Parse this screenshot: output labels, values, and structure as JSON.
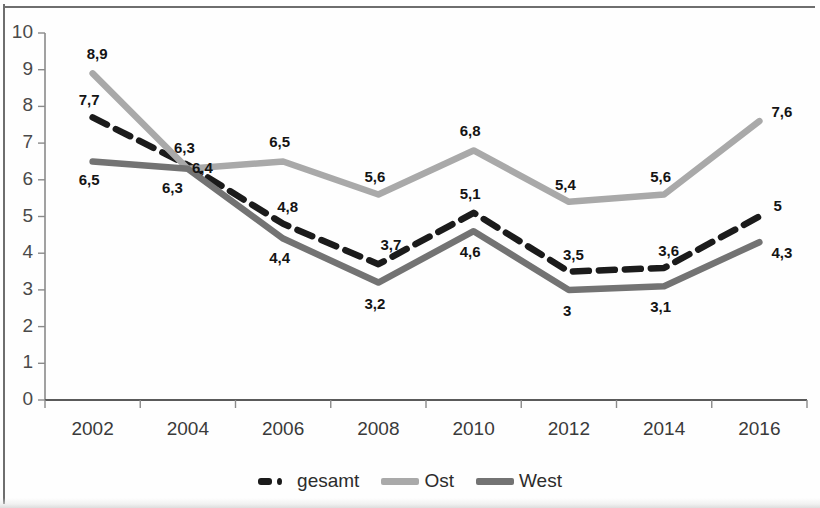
{
  "chart_data": {
    "type": "line",
    "title": "",
    "subtitle": "",
    "xlabel": "",
    "ylabel": "",
    "ylim": [
      0,
      10
    ],
    "ytick_labels": [
      "0",
      "1",
      "2",
      "3",
      "4",
      "5",
      "6",
      "7",
      "8",
      "9",
      "10"
    ],
    "categories": [
      "2002",
      "2004",
      "2006",
      "2008",
      "2010",
      "2012",
      "2014",
      "2016"
    ],
    "grid": false,
    "legend_position": "bottom",
    "series": [
      {
        "name": "gesamt",
        "style": "dashed",
        "color": "#1b1b1b",
        "values": [
          7.7,
          6.4,
          4.8,
          3.7,
          5.1,
          3.5,
          3.6,
          5.0
        ],
        "labels": [
          "7,7",
          "6,4",
          "4,8",
          "3,7",
          "5,1",
          "3,5",
          "3,6",
          "5"
        ]
      },
      {
        "name": "Ost",
        "style": "solid",
        "color": "#a9a9a9",
        "values": [
          8.9,
          6.3,
          6.5,
          5.6,
          6.8,
          5.4,
          5.6,
          7.6
        ],
        "labels": [
          "8,9",
          "6,3",
          "6,5",
          "5,6",
          "6,8",
          "5,4",
          "5,6",
          "7,6"
        ]
      },
      {
        "name": "West",
        "style": "solid",
        "color": "#737373",
        "values": [
          6.5,
          6.3,
          4.4,
          3.2,
          4.6,
          3.0,
          3.1,
          4.3
        ],
        "labels": [
          "6,5",
          "6,3",
          "4,4",
          "3,2",
          "4,6",
          "3",
          "3,1",
          "4,3"
        ]
      }
    ]
  },
  "legend": {
    "items": [
      {
        "label": "gesamt",
        "color": "#1b1b1b",
        "style": "dashed"
      },
      {
        "label": "Ost",
        "color": "#a9a9a9",
        "style": "solid"
      },
      {
        "label": "West",
        "color": "#737373",
        "style": "solid"
      }
    ]
  },
  "axes": {
    "y_min": 0,
    "y_max": 10,
    "y_step": 1,
    "x_categories": [
      "2002",
      "2004",
      "2006",
      "2008",
      "2010",
      "2012",
      "2014",
      "2016"
    ]
  },
  "label_offsets": {
    "gesamt": [
      {
        "dx": -14,
        "dy": -26
      },
      {
        "dx": 4,
        "dy": -6
      },
      {
        "dx": -6,
        "dy": -26
      },
      {
        "dx": 2,
        "dy": -28
      },
      {
        "dx": -14,
        "dy": -28
      },
      {
        "dx": -6,
        "dy": -26
      },
      {
        "dx": -6,
        "dy": -26
      },
      {
        "dx": 14,
        "dy": -20
      }
    ],
    "Ost": [
      {
        "dx": -6,
        "dy": -28
      },
      {
        "dx": -14,
        "dy": -30
      },
      {
        "dx": -14,
        "dy": -28
      },
      {
        "dx": -14,
        "dy": -26
      },
      {
        "dx": -14,
        "dy": -28
      },
      {
        "dx": -14,
        "dy": -26
      },
      {
        "dx": -14,
        "dy": -26
      },
      {
        "dx": 12,
        "dy": -18
      }
    ],
    "West": [
      {
        "dx": -14,
        "dy": 10
      },
      {
        "dx": -26,
        "dy": 10
      },
      {
        "dx": -14,
        "dy": 10
      },
      {
        "dx": -14,
        "dy": 12
      },
      {
        "dx": -14,
        "dy": 12
      },
      {
        "dx": -6,
        "dy": 12
      },
      {
        "dx": -14,
        "dy": 12
      },
      {
        "dx": 12,
        "dy": 2
      }
    ]
  }
}
